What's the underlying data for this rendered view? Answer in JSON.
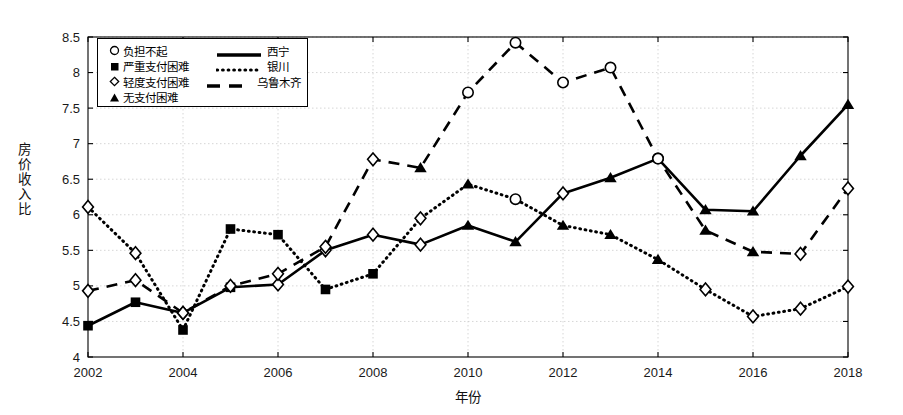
{
  "chart_data": {
    "type": "line",
    "title": "",
    "xlabel": "年份",
    "ylabel": "房价收入比",
    "grid": true,
    "legend_position": "top-left",
    "xlim": [
      2002,
      2018
    ],
    "ylim": [
      4,
      8.5
    ],
    "yticks": [
      "4",
      "4.5",
      "5",
      "5.5",
      "6",
      "6.5",
      "7",
      "7.5",
      "8",
      "8.5"
    ],
    "ytick_values": [
      4,
      4.5,
      5,
      5.5,
      6,
      6.5,
      7,
      7.5,
      8,
      8.5
    ],
    "xticks": [
      "2002",
      "2004",
      "2006",
      "2008",
      "2010",
      "2012",
      "2014",
      "2016",
      "2018"
    ],
    "xtick_values": [
      2002,
      2004,
      2006,
      2008,
      2010,
      2012,
      2014,
      2016,
      2018
    ],
    "x": [
      2002,
      2003,
      2004,
      2005,
      2006,
      2007,
      2008,
      2009,
      2010,
      2011,
      2012,
      2013,
      2014,
      2015,
      2016,
      2017,
      2018
    ],
    "series": [
      {
        "name": "西宁",
        "line_style": "solid",
        "values": [
          4.44,
          4.77,
          4.62,
          4.98,
          5.02,
          5.5,
          5.72,
          5.58,
          5.85,
          5.62,
          6.3,
          6.52,
          6.79,
          6.07,
          6.05,
          6.83,
          7.55
        ]
      },
      {
        "name": "银川",
        "line_style": "dotted",
        "values": [
          6.11,
          5.46,
          4.38,
          5.8,
          5.72,
          4.95,
          5.17,
          5.95,
          6.43,
          6.22,
          5.85,
          5.72,
          5.37,
          4.95,
          4.57,
          4.68,
          4.99
        ]
      },
      {
        "name": "乌鲁木齐",
        "line_style": "dashed",
        "values": [
          4.93,
          5.08,
          4.62,
          5.0,
          5.17,
          5.55,
          6.78,
          6.66,
          7.72,
          8.42,
          7.86,
          8.07,
          6.79,
          5.78,
          5.48,
          5.45,
          6.37
        ]
      }
    ],
    "marker_legend": [
      {
        "marker": "circle-open",
        "label": "负担不起"
      },
      {
        "marker": "square-filled",
        "label": "严重支付困难"
      },
      {
        "marker": "diamond-open",
        "label": "轻度支付困难"
      },
      {
        "marker": "triangle-filled",
        "label": "无支付困难"
      }
    ],
    "point_markers": {
      "西宁": [
        "square-filled",
        "square-filled",
        "diamond-open",
        "square-filled",
        "diamond-open",
        "diamond-open",
        "diamond-open",
        "diamond-open",
        "triangle-filled",
        "triangle-filled",
        "diamond-open",
        "triangle-filled",
        "circle-open",
        "triangle-filled",
        "triangle-filled",
        "triangle-filled",
        "triangle-filled"
      ],
      "银川": [
        "diamond-open",
        "diamond-open",
        "square-filled",
        "square-filled",
        "square-filled",
        "square-filled",
        "square-filled",
        "diamond-open",
        "triangle-filled",
        "circle-open",
        "triangle-filled",
        "triangle-filled",
        "triangle-filled",
        "diamond-open",
        "diamond-open",
        "diamond-open",
        "diamond-open"
      ],
      "乌鲁木齐": [
        "diamond-open",
        "diamond-open",
        "diamond-open",
        "diamond-open",
        "diamond-open",
        "diamond-open",
        "diamond-open",
        "triangle-filled",
        "circle-open",
        "circle-open",
        "circle-open",
        "circle-open",
        "circle-open",
        "triangle-filled",
        "triangle-filled",
        "diamond-open",
        "diamond-open"
      ]
    },
    "colors": {
      "line": "#000000",
      "grid": "#cccccc",
      "axis": "#000000",
      "background": "#ffffff"
    }
  }
}
